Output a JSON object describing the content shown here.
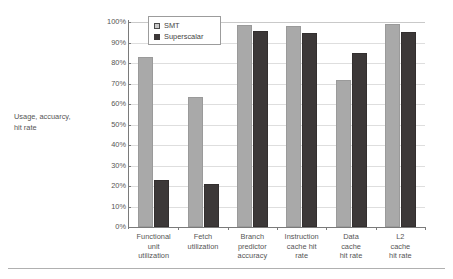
{
  "chart_data": {
    "type": "bar",
    "title": "",
    "xlabel": "",
    "ylabel": "Usage, accuarcy, hit rate",
    "ylim": [
      0,
      100
    ],
    "yticks": [
      "0%",
      "10%",
      "20%",
      "30%",
      "40%",
      "50%",
      "60%",
      "70%",
      "80%",
      "90%",
      "100%"
    ],
    "ytick_values": [
      0,
      10,
      20,
      30,
      40,
      50,
      60,
      70,
      80,
      90,
      100
    ],
    "grid": true,
    "legend_position": "top-left-inside",
    "categories": [
      "Functional\nunit\nutilization",
      "Fetch\nutilization",
      "Branch\npredictor\naccuracy",
      "Instruction\ncache hit\nrate",
      "Data\ncache\nhit rate",
      "L2\ncache\nhit rate"
    ],
    "series": [
      {
        "name": "SMT",
        "color": "#a9a9a9",
        "values": [
          83,
          63.5,
          98.5,
          98,
          71.5,
          99
        ]
      },
      {
        "name": "Superscalar",
        "color": "#3c3838",
        "values": [
          23,
          21,
          95.5,
          94.5,
          85,
          95
        ]
      }
    ]
  },
  "axis": {
    "y_title_line1": "Usage, accuarcy,",
    "y_title_line2": "hit rate"
  },
  "legend": {
    "items": [
      {
        "label": "SMT",
        "swatch": "legend-swatch-smt"
      },
      {
        "label": "Superscalar",
        "swatch": "legend-swatch-superscalar"
      }
    ]
  },
  "colors": {
    "smt": "#a9a9a9",
    "superscalar": "#3c3838",
    "gridline": "#dedede",
    "axis": "#7a7a7a",
    "text": "#555555"
  }
}
